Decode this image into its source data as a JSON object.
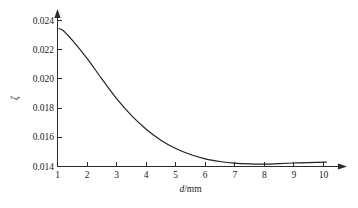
{
  "chart_data": {
    "type": "line",
    "title": "",
    "subtitle": "",
    "xlabel": "d/mm",
    "xlabel_italic_part": "d",
    "xlabel_rest": "/mm",
    "ylabel": "ζ",
    "xlim": [
      1,
      10
    ],
    "ylim": [
      0.014,
      0.024
    ],
    "grid": false,
    "legend": null,
    "legend_position": "none",
    "xticks": [
      1,
      2,
      3,
      4,
      5,
      6,
      7,
      8,
      9,
      10
    ],
    "xtick_labels": [
      "1",
      "2",
      "3",
      "4",
      "5",
      "6",
      "7",
      "8",
      "9",
      "10"
    ],
    "yticks": [
      0.014,
      0.016,
      0.018,
      0.02,
      0.022,
      0.024
    ],
    "ytick_labels": [
      "0.014",
      "0.016",
      "0.018",
      "0.020",
      "0.022",
      "0.024"
    ],
    "series": [
      {
        "name": "zeta vs d",
        "color": "#1f1f1f",
        "x": [
          1.05,
          1.2,
          1.5,
          2.0,
          2.5,
          3.0,
          3.5,
          4.0,
          4.5,
          5.0,
          5.5,
          6.0,
          6.5,
          7.0,
          7.5,
          8.0,
          8.5,
          9.0,
          9.5,
          10.1
        ],
        "y": [
          0.02345,
          0.0233,
          0.02265,
          0.0214,
          0.02,
          0.01865,
          0.0175,
          0.01655,
          0.0158,
          0.01523,
          0.01482,
          0.01452,
          0.01434,
          0.01423,
          0.01418,
          0.01416,
          0.0142,
          0.01424,
          0.01427,
          0.0143
        ]
      }
    ],
    "annotations": []
  },
  "axes": {
    "x_axis_name": "x-axis",
    "y_axis_name": "y-axis",
    "x_arrow": true,
    "y_arrow": true
  }
}
